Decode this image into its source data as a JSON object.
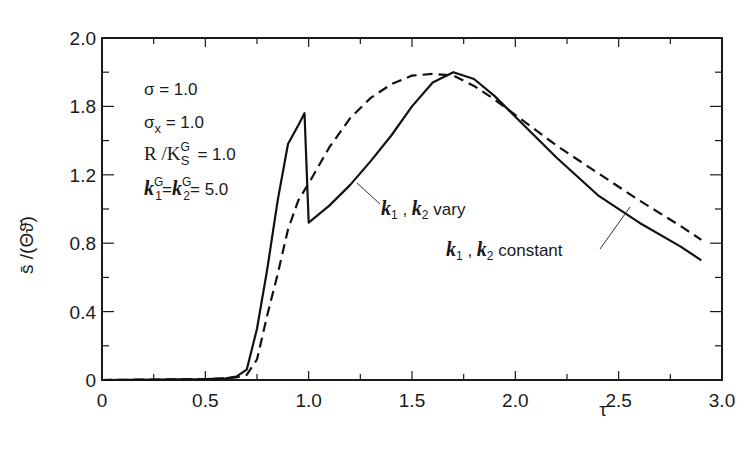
{
  "chart_data": {
    "type": "line",
    "title": "",
    "xlabel": "τ",
    "ylabel": "s̄ /(Θϑ̄)",
    "xlim": [
      0,
      3.0
    ],
    "ylim": [
      0,
      2.0
    ],
    "grid": false,
    "x_ticks": [
      "0",
      "0.5",
      "1.0",
      "1.5",
      "2.0",
      "2.5",
      "3.0"
    ],
    "y_ticks": [
      "0",
      "0.4",
      "0.8",
      "1.2",
      "1.8",
      "2.0"
    ],
    "parameters": [
      "σ = 1.0",
      "σx = 1.0",
      "R/KSG = 1.0",
      "k1G = k2G = 5.0"
    ],
    "series": [
      {
        "name": "k1, k2 vary",
        "style": "solid",
        "x": [
          0,
          0.5,
          0.6,
          0.65,
          0.7,
          0.75,
          0.8,
          0.85,
          0.9,
          0.95,
          0.98,
          1.0,
          1.1,
          1.2,
          1.3,
          1.4,
          1.5,
          1.6,
          1.7,
          1.8,
          1.9,
          2.0,
          2.2,
          2.4,
          2.6,
          2.8,
          2.9
        ],
        "y": [
          0,
          0.005,
          0.01,
          0.02,
          0.06,
          0.3,
          0.65,
          1.05,
          1.38,
          1.49,
          1.56,
          0.92,
          1.02,
          1.14,
          1.28,
          1.43,
          1.6,
          1.74,
          1.8,
          1.76,
          1.66,
          1.54,
          1.3,
          1.08,
          0.92,
          0.78,
          0.7
        ]
      },
      {
        "name": "k1, k2 constant",
        "style": "dashed",
        "x": [
          0,
          0.5,
          0.6,
          0.65,
          0.7,
          0.75,
          0.8,
          0.85,
          0.9,
          0.95,
          1.0,
          1.1,
          1.2,
          1.3,
          1.4,
          1.5,
          1.6,
          1.7,
          1.8,
          1.9,
          2.0,
          2.2,
          2.4,
          2.6,
          2.8,
          2.9
        ],
        "y": [
          0,
          0.005,
          0.01,
          0.015,
          0.03,
          0.12,
          0.38,
          0.62,
          0.88,
          1.05,
          1.15,
          1.36,
          1.53,
          1.65,
          1.73,
          1.78,
          1.79,
          1.78,
          1.72,
          1.64,
          1.55,
          1.37,
          1.21,
          1.05,
          0.9,
          0.82
        ]
      }
    ]
  },
  "labels": {
    "y_axis": "s̄ /(Θϑ̄)",
    "x_axis": "τ",
    "param_sigma": "σ = 1.0",
    "param_sigma_x_base": "σ",
    "param_sigma_x_sub": "x",
    "param_sigma_x_val": " = 1.0",
    "param_r_base": "R /K",
    "param_r_sup": "G",
    "param_r_sub": "S",
    "param_r_val": "= 1.0",
    "param_k_val": "= 5.0",
    "legend_vary": "vary",
    "legend_constant": "constant"
  }
}
